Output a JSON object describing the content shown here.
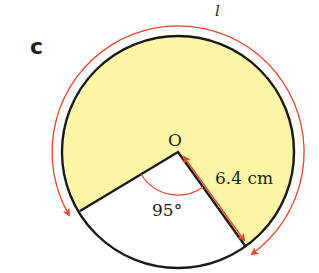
{
  "part_label": "c",
  "arc_label": "l",
  "center_label": "O",
  "radius_label": "6.4 cm",
  "angle_label": "95°",
  "colors": {
    "sector_fill": "#fdf6a6",
    "outline": "#1a1a1a",
    "arrow": "#e8452c"
  },
  "geometry": {
    "radius_cm": 6.4,
    "excluded_angle_deg": 95,
    "shaded_angle_deg": 265
  }
}
